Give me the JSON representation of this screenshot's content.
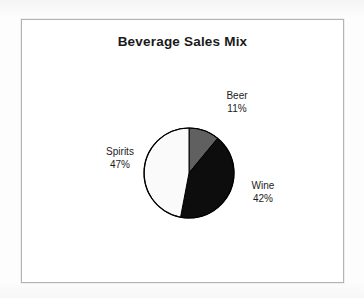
{
  "figure": {
    "title": "Beverage Sales Mix",
    "background_color": "#fdfdfd",
    "frame_color": "#b3b3b3",
    "plot_background": "#ffffff"
  },
  "chart_data": {
    "type": "pie",
    "title": "Beverage Sales Mix",
    "xlabel": "",
    "ylabel": "",
    "categories": [
      "Beer",
      "Wine",
      "Spirits"
    ],
    "values": [
      11,
      42,
      47
    ],
    "value_unit": "percent",
    "labels": [
      "11%",
      "42%",
      "47%"
    ],
    "colors": [
      "#606060",
      "#0d0d0d",
      "#fafafa"
    ],
    "slice_outline_color": "#000000",
    "start_angle_deg": 0,
    "direction": "clockwise",
    "legend": "none",
    "labels_position": "outside",
    "grid": false,
    "slices": [
      {
        "name": "Beer",
        "value": 11,
        "label": "11%",
        "color": "#606060",
        "start_deg": 0.0,
        "end_deg": 39.6
      },
      {
        "name": "Wine",
        "value": 42,
        "label": "42%",
        "color": "#0d0d0d",
        "start_deg": 39.6,
        "end_deg": 190.8
      },
      {
        "name": "Spirits",
        "value": 47,
        "label": "47%",
        "color": "#fafafa",
        "start_deg": 190.8,
        "end_deg": 360.0
      }
    ]
  }
}
